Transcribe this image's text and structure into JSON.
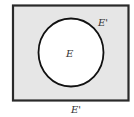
{
  "diagram": {
    "type": "venn",
    "title": "",
    "universe": {
      "label": "E'",
      "fill": "#e6e6e6",
      "stroke": "#2a2a2a"
    },
    "set": {
      "label": "E",
      "fill": "#ffffff",
      "stroke": "#111111"
    },
    "complement_label_inside": "E'",
    "complement_label_below": "E'"
  }
}
